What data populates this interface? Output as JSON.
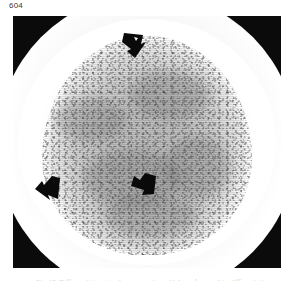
{
  "page": {
    "number": "604",
    "background_color": "#ffffff"
  },
  "figure": {
    "name": "head-ct-scan",
    "modality": "CT",
    "anatomy": "brain / head axial section",
    "frame_color": "#0b0b0b",
    "caption": {
      "label": "Fig. 18.",
      "text": "Fig. 18.  Diffuse white matter low attenuation with loss of grey-white differentiation",
      "cropped": true
    },
    "annotations": [
      {
        "name": "arrow-superior",
        "label": "arrow",
        "direction": "down",
        "color": "#0a0a0a",
        "x_pct": 44,
        "y_pct": 6
      },
      {
        "name": "arrow-left-lateral",
        "label": "arrow",
        "direction": "right",
        "color": "#0a0a0a",
        "x_pct": 9,
        "y_pct": 61
      },
      {
        "name": "arrow-central",
        "label": "arrow",
        "direction": "left",
        "color": "#0a0a0a",
        "x_pct": 45,
        "y_pct": 58
      }
    ]
  }
}
